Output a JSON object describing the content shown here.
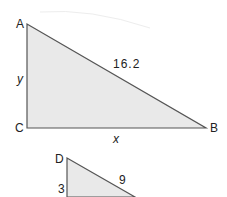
{
  "diagram": {
    "triangle_abc": {
      "vertices": {
        "A": "A",
        "B": "B",
        "C": "C"
      },
      "sides": {
        "hypotenuse_AB": "16.2",
        "vertical_AC": "y",
        "horizontal_CB": "x"
      },
      "right_angle_at": "C",
      "fill": "#e9e9e9",
      "stroke": "#555555"
    },
    "triangle_d": {
      "vertices": {
        "D": "D"
      },
      "sides": {
        "hypotenuse": "9",
        "vertical": "3"
      },
      "fill": "#e9e9e9",
      "stroke": "#555555"
    }
  }
}
